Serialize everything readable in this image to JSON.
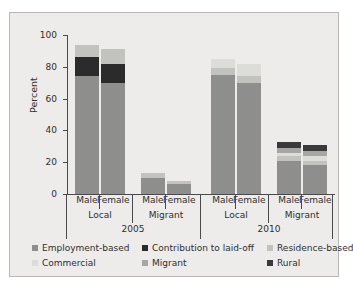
{
  "chart_data": {
    "type": "bar",
    "stacked": true,
    "title": "",
    "xlabel": "",
    "ylabel": "Percent",
    "ylim": [
      0,
      100
    ],
    "yticks": [
      0,
      20,
      40,
      60,
      80,
      100
    ],
    "grid": false,
    "legend_position": "bottom",
    "categories": [
      "2005 Local Male",
      "2005 Local Female",
      "2005 Migrant Male",
      "2005 Migrant Female",
      "2010 Local Male",
      "2010 Local Female",
      "2010 Migrant Male",
      "2010 Migrant Female"
    ],
    "group_labels": {
      "level1": [
        "Male",
        "Female",
        "Male",
        "Female",
        "Male",
        "Female",
        "Male",
        "Female"
      ],
      "level2": [
        "Local",
        "Migrant",
        "Local",
        "Migrant"
      ],
      "level3": [
        "2005",
        "2010"
      ]
    },
    "series": [
      {
        "name": "Employment-based",
        "color": "#8e8e8c",
        "values": [
          74,
          70,
          10,
          6,
          75,
          70,
          21,
          18
        ]
      },
      {
        "name": "Contribution to laid-off",
        "color": "#2b2b2b",
        "values": [
          12,
          12,
          0,
          0,
          0,
          0,
          0,
          0
        ]
      },
      {
        "name": "Residence-based",
        "color": "#c2c2bf",
        "values": [
          8,
          9,
          3,
          2,
          4,
          4,
          3,
          3
        ]
      },
      {
        "name": "Commercial",
        "color": "#dcdcd8",
        "values": [
          0,
          0,
          0,
          0,
          6,
          8,
          2,
          3
        ]
      },
      {
        "name": "Migrant",
        "color": "#a6a6a3",
        "values": [
          0,
          0,
          0,
          0,
          0,
          0,
          3,
          3
        ]
      },
      {
        "name": "Rural",
        "color": "#3a3a3a",
        "values": [
          0,
          0,
          0,
          0,
          0,
          0,
          4,
          4
        ]
      }
    ],
    "totals": [
      94,
      91,
      13,
      8,
      85,
      82,
      33,
      31
    ]
  },
  "axis": {
    "y_label": "Percent",
    "y_ticks": [
      "0",
      "20",
      "40",
      "60",
      "80",
      "100"
    ]
  },
  "groups": {
    "level1": [
      {
        "label": "Male"
      },
      {
        "label": "Female"
      },
      {
        "label": "Male"
      },
      {
        "label": "Female"
      },
      {
        "label": "Male"
      },
      {
        "label": "Female"
      },
      {
        "label": "Male"
      },
      {
        "label": "Female"
      }
    ],
    "level2": [
      {
        "label": "Local"
      },
      {
        "label": "Migrant"
      },
      {
        "label": "Local"
      },
      {
        "label": "Migrant"
      }
    ],
    "level3": [
      {
        "label": "2005"
      },
      {
        "label": "2010"
      }
    ]
  },
  "legend": {
    "row1": [
      {
        "label": "Employment-based",
        "color": "#8e8e8c"
      },
      {
        "label": "Contribution to laid-off",
        "color": "#2b2b2b"
      },
      {
        "label": "Residence-based",
        "color": "#c2c2bf"
      }
    ],
    "row2": [
      {
        "label": "Commercial",
        "color": "#dcdcd8"
      },
      {
        "label": "Migrant",
        "color": "#a6a6a3"
      },
      {
        "label": "Rural",
        "color": "#3a3a3a"
      }
    ]
  }
}
